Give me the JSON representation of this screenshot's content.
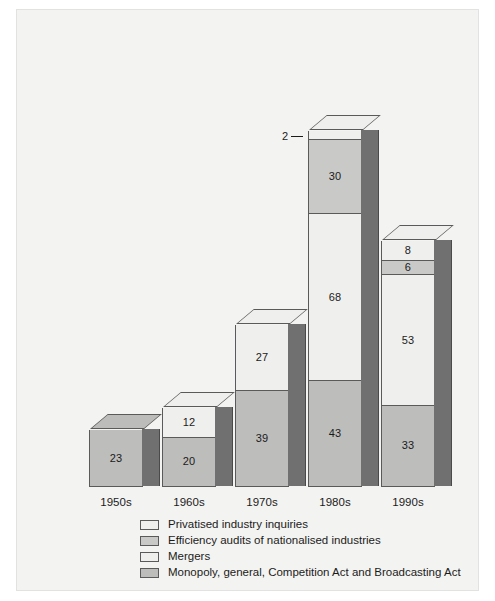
{
  "chart_data": {
    "type": "bar",
    "subtype": "stacked-3d-column",
    "title": "",
    "xlabel": "",
    "ylabel": "",
    "grid": false,
    "legend_position": "bottom",
    "categories": [
      "1950s",
      "1960s",
      "1970s",
      "1980s",
      "1990s"
    ],
    "series": [
      {
        "name": "Privatised industry inquiries",
        "color": "#efefed",
        "values": [
          null,
          null,
          null,
          2,
          8
        ]
      },
      {
        "name": "Efficiency audits of nationalised industries",
        "color": "#c9c9c7",
        "values": [
          null,
          null,
          null,
          30,
          6
        ]
      },
      {
        "name": "Mergers",
        "color": "#efefed",
        "values": [
          null,
          12,
          27,
          68,
          53
        ]
      },
      {
        "name": "Monopoly, general, Competition Act and Broadcasting Act",
        "color": "#bdbdbb",
        "values": [
          23,
          20,
          39,
          43,
          33
        ]
      }
    ],
    "totals": [
      23,
      32,
      66,
      143,
      100
    ],
    "bars": [
      {
        "category": "1950s",
        "segments": [
          {
            "series": "Monopoly, general, Competition Act and Broadcasting Act",
            "value": 23,
            "label": "23",
            "fill": "c-monopoly",
            "top_shade": "shade-dark"
          }
        ]
      },
      {
        "category": "1960s",
        "segments": [
          {
            "series": "Mergers",
            "value": 12,
            "label": "12",
            "fill": "c-mergers",
            "top_shade": ""
          },
          {
            "series": "Monopoly, general, Competition Act and Broadcasting Act",
            "value": 20,
            "label": "20",
            "fill": "c-monopoly",
            "top_shade": ""
          }
        ]
      },
      {
        "category": "1970s",
        "segments": [
          {
            "series": "Mergers",
            "value": 27,
            "label": "27",
            "fill": "c-mergers",
            "top_shade": ""
          },
          {
            "series": "Monopoly, general, Competition Act and Broadcasting Act",
            "value": 39,
            "label": "39",
            "fill": "c-monopoly",
            "top_shade": ""
          }
        ]
      },
      {
        "category": "1980s",
        "segments": [
          {
            "series": "Privatised industry inquiries",
            "value": 2,
            "label": "2",
            "fill": "c-privatised",
            "callout": true,
            "top_shade": ""
          },
          {
            "series": "Efficiency audits of nationalised industries",
            "value": 30,
            "label": "30",
            "fill": "c-efficiency",
            "top_shade": ""
          },
          {
            "series": "Mergers",
            "value": 68,
            "label": "68",
            "fill": "c-mergers",
            "top_shade": ""
          },
          {
            "series": "Monopoly, general, Competition Act and Broadcasting Act",
            "value": 43,
            "label": "43",
            "fill": "c-monopoly",
            "top_shade": ""
          }
        ]
      },
      {
        "category": "1990s",
        "segments": [
          {
            "series": "Privatised industry inquiries",
            "value": 8,
            "label": "8",
            "fill": "c-privatised",
            "top_shade": ""
          },
          {
            "series": "Efficiency audits of nationalised industries",
            "value": 6,
            "label": "6",
            "fill": "c-efficiency",
            "top_shade": ""
          },
          {
            "series": "Mergers",
            "value": 53,
            "label": "53",
            "fill": "c-mergers",
            "top_shade": ""
          },
          {
            "series": "Monopoly, general, Competition Act and Broadcasting Act",
            "value": 33,
            "label": "33",
            "fill": "c-monopoly",
            "top_shade": ""
          }
        ]
      }
    ]
  },
  "axis": {
    "tick_labels": [
      "1950s",
      "1960s",
      "1970s",
      "1980s",
      "1990s"
    ]
  },
  "callouts": [
    {
      "text": "2",
      "for_category": "1980s",
      "for_series": "Privatised industry inquiries"
    }
  ],
  "legend": {
    "items": [
      {
        "label": "Privatised industry inquiries",
        "swatch": "#efefed"
      },
      {
        "label": "Efficiency audits of nationalised industries",
        "swatch": "#c9c9c7"
      },
      {
        "label": "Mergers",
        "swatch": "#efefed"
      },
      {
        "label": "Monopoly, general, Competition Act and Broadcasting Act",
        "swatch": "#bdbdbb"
      }
    ]
  },
  "colors": {
    "panel_background": "#f3f3f1",
    "panel_border": "#e2e2e0",
    "bar_outline": "#5a5a5a",
    "side_face": "#707070",
    "text": "#1b1b1b",
    "white_segment": "#efefed",
    "light_grey_segment": "#c9c9c7",
    "mid_grey_segment": "#bdbdbb"
  }
}
